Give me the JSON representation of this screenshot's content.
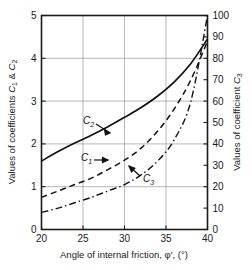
{
  "chart_data": {
    "type": "line",
    "title": "",
    "xlabel": "Angle of internal friction, φ', (°)",
    "ylabel_left": "Values of coefficients C₁ & C₂",
    "ylabel_right": "Values of coefficient C₃",
    "xlim": [
      20,
      40
    ],
    "ylim_left": [
      0,
      5
    ],
    "ylim_right": [
      0,
      100
    ],
    "xticks": [
      20,
      25,
      30,
      35,
      40
    ],
    "yticks_left": [
      0,
      1,
      2,
      3,
      4,
      5
    ],
    "yticks_right": [
      0,
      10,
      20,
      30,
      40,
      50,
      60,
      70,
      80,
      90,
      100
    ],
    "grid": true,
    "grid_vertical_at": [
      25,
      30,
      35
    ],
    "grid_horizontal_left_at": [
      1,
      2,
      3,
      4
    ],
    "legend_position": "inline-annotations",
    "x": [
      20,
      22,
      24,
      26,
      28,
      30,
      32,
      34,
      36,
      38,
      40
    ],
    "series": [
      {
        "name": "C2",
        "label": "C₂",
        "axis": "left",
        "style": "solid",
        "values": [
          1.6,
          1.82,
          2.02,
          2.2,
          2.4,
          2.62,
          2.85,
          3.12,
          3.45,
          3.88,
          4.45
        ]
      },
      {
        "name": "C1",
        "label": "C₁",
        "axis": "left",
        "style": "dashed",
        "values": [
          0.75,
          0.9,
          1.05,
          1.2,
          1.4,
          1.62,
          1.9,
          2.3,
          2.82,
          3.5,
          4.4
        ]
      },
      {
        "name": "C3",
        "label": "C₃",
        "axis": "right",
        "style": "dash-dot",
        "values": [
          8,
          10,
          12.5,
          15,
          18,
          21,
          25.5,
          32,
          42,
          60,
          100
        ]
      }
    ],
    "annotations": [
      {
        "name": "C2",
        "label": "C",
        "sub": "2",
        "x_px": 83,
        "y_px": 124
      },
      {
        "name": "C1",
        "label": "C",
        "sub": "1",
        "x_px": 81,
        "y_px": 161
      },
      {
        "name": "C3",
        "label": "C",
        "sub": "3",
        "x_px": 143,
        "y_px": 182
      }
    ],
    "colors": {
      "axis": "#1a1a1a",
      "grid": "#9a9a9a",
      "curve": "#111111",
      "background": "#ffffff"
    }
  },
  "labels": {
    "x_axis_main": "Angle of internal friction, ",
    "x_axis_phi": "φ',",
    "x_axis_deg": "(°)",
    "y_left_pre": "Values of coefficients ",
    "y_left_c1": "C",
    "y_left_sub1": "1",
    "y_left_amp": " & ",
    "y_left_c2": "C",
    "y_left_sub2": "2",
    "y_right_pre": "Values of coefficient ",
    "y_right_c3": "C",
    "y_right_sub3": "3"
  },
  "ticks": {
    "x": [
      "20",
      "25",
      "30",
      "35",
      "40"
    ],
    "left": [
      "0",
      "1",
      "2",
      "3",
      "4",
      "5"
    ],
    "right": [
      "0",
      "10",
      "20",
      "30",
      "40",
      "50",
      "60",
      "70",
      "80",
      "90",
      "100"
    ]
  }
}
